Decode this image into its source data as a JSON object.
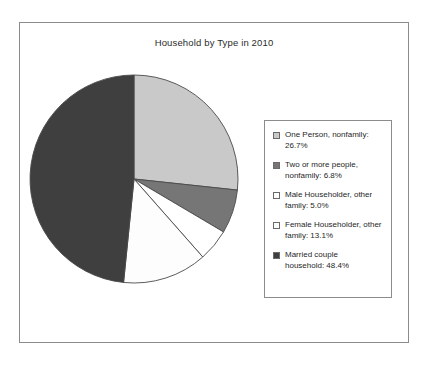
{
  "chart_data": {
    "type": "pie",
    "title": "Household by Type in 2010",
    "xlabel": "",
    "ylabel": "",
    "legend_position": "right",
    "grid": false,
    "unit": "percent",
    "start_angle_deg": 0,
    "direction": "clockwise",
    "categories": [
      "One Person, nonfamily",
      "Two or more people, nonfamily",
      "Male Householder, other family",
      "Female Householder, other family",
      "Married couple household"
    ],
    "values": [
      26.7,
      6.8,
      5.0,
      13.1,
      48.4
    ],
    "slices": [
      {
        "label": "One Person, nonfamily",
        "value": 26.7,
        "value_text": "26.7%",
        "color": "#c9c9c9",
        "legend_text": "One Person, nonfamily: 26.7%"
      },
      {
        "label": "Two or more people, nonfamily",
        "value": 6.8,
        "value_text": "6.8%",
        "color": "#767676",
        "legend_text": "Two or more people, nonfamily: 6.8%"
      },
      {
        "label": "Male Householder, other family",
        "value": 5.0,
        "value_text": "5.0%",
        "color": "#ffffff",
        "legend_text": "Male Householder, other family: 5.0%"
      },
      {
        "label": "Female Householder, other family",
        "value": 13.1,
        "value_text": "13.1%",
        "color": "#fdfdfd",
        "legend_text": "Female Householder, other family: 13.1%"
      },
      {
        "label": "Married couple household",
        "value": 48.4,
        "value_text": "48.4%",
        "color": "#3f3f3f",
        "legend_text": "Married couple household: 48.4%"
      }
    ]
  },
  "legend": {
    "items": [
      {
        "line1": "One Person, nonfamily:",
        "line2": "26.7%",
        "color": "#c9c9c9"
      },
      {
        "line1": "Two or more people,",
        "line2": "nonfamily: 6.8%",
        "color": "#767676"
      },
      {
        "line1": "Male Householder, other",
        "line2": "family: 5.0%",
        "color": "#ffffff"
      },
      {
        "line1": "Female Householder, other",
        "line2": "family: 13.1%",
        "color": "#fdfdfd"
      },
      {
        "line1": "Married couple",
        "line2": "household: 48.4%",
        "color": "#3f3f3f"
      }
    ]
  },
  "colors": {
    "one_person": "#c9c9c9",
    "two_or_more": "#767676",
    "male_householder": "#ffffff",
    "female_householder": "#fdfdfd",
    "married_couple": "#3f3f3f",
    "outline": "#4a4a4a",
    "frame": "#8c8c8c",
    "text": "#1f1f1f"
  }
}
